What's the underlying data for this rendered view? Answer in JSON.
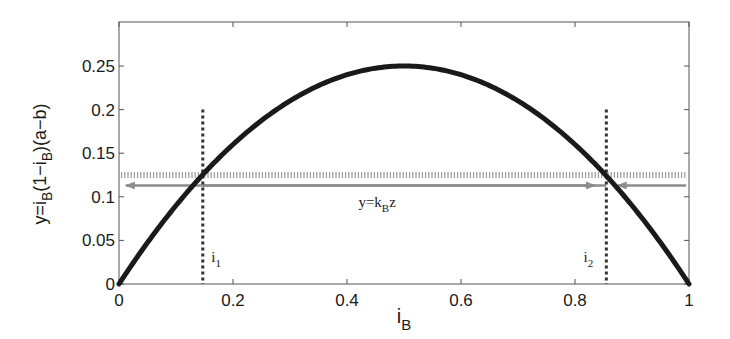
{
  "chart_data": {
    "type": "line",
    "title": "",
    "xlabel": "i_B",
    "ylabel": "y=i_B(1−i_B)(a−b)",
    "xlim": [
      0,
      1
    ],
    "ylim": [
      0,
      0.3
    ],
    "grid": false,
    "legend": null,
    "x_ticks": [
      0,
      0.2,
      0.4,
      0.6,
      0.8,
      1
    ],
    "x_tick_labels": [
      "0",
      "0.2",
      "0.4",
      "0.6",
      "0.8",
      "1"
    ],
    "y_ticks": [
      0,
      0.05,
      0.1,
      0.15,
      0.2,
      0.25
    ],
    "y_tick_labels": [
      "0",
      "0.05",
      "0.1",
      "0.15",
      "0.2",
      "0.25"
    ],
    "series": [
      {
        "name": "y=i_B(1−i_B)(a−b)",
        "kind": "curve",
        "function": "x*(1-x)",
        "x": [
          0,
          0.1,
          0.2,
          0.3,
          0.4,
          0.5,
          0.6,
          0.7,
          0.8,
          0.9,
          1.0
        ],
        "values": [
          0,
          0.09,
          0.16,
          0.21,
          0.24,
          0.25,
          0.24,
          0.21,
          0.16,
          0.09,
          0
        ],
        "color": "#1a1a1a",
        "width": 5
      },
      {
        "name": "upper hatched level",
        "kind": "hline",
        "y": 0.125,
        "style": "hatched",
        "color": "#9a9a9a"
      },
      {
        "name": "y=k_B z",
        "kind": "hline-arrows",
        "y": 0.113,
        "color": "#8c8c8c",
        "arrows": [
          {
            "from": 0.855,
            "to": 0.012,
            "direction": "left"
          },
          {
            "from": 0.147,
            "to": 0.835,
            "direction": "right"
          },
          {
            "from": 0.995,
            "to": 0.875,
            "direction": "left"
          }
        ]
      },
      {
        "name": "i_1",
        "kind": "vline",
        "x": 0.147,
        "y_top": 0.2,
        "style": "dotted",
        "color": "#333333"
      },
      {
        "name": "i_2",
        "kind": "vline",
        "x": 0.855,
        "y_top": 0.2,
        "style": "dotted",
        "color": "#333333"
      }
    ],
    "annotations": [
      {
        "text": "y=k",
        "sub": "B",
        "after": "z",
        "x": 0.42,
        "y": 0.088
      },
      {
        "text": "i",
        "sub": "1",
        "after": "",
        "x": 0.162,
        "y": 0.025
      },
      {
        "text": "i",
        "sub": "2",
        "after": "",
        "x": 0.815,
        "y": 0.025
      }
    ]
  },
  "axes": {
    "xlabel_main": "i",
    "xlabel_sub": "B",
    "ylabel_parts": [
      "y=i",
      "B",
      "(1−i",
      "B",
      ")(a−b)"
    ],
    "y0_extra_label": "0"
  }
}
